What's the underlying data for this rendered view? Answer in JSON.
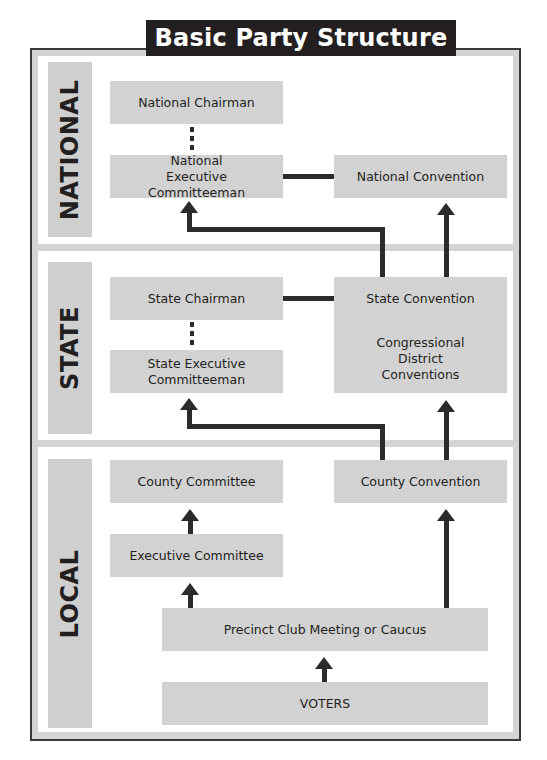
{
  "title": "Basic Party Structure",
  "levels": {
    "national": {
      "label": "NATIONAL",
      "national_chairman": "National Chairman",
      "national_executive_committeeman": "National Executive Committeeman",
      "national_convention": "National Convention"
    },
    "state": {
      "label": "STATE",
      "state_chairman": "State Chairman",
      "state_executive_committeeman": "State Executive Committeeman",
      "state_convention": "State Convention",
      "congressional_district_conventions": "Congressional District Conventions"
    },
    "local": {
      "label": "LOCAL",
      "county_committee": "County Committee",
      "county_convention": "County Convention",
      "executive_committee": "Executive Committee",
      "precinct_meeting": "Precinct Club Meeting or Caucus",
      "voters": "VOTERS"
    }
  },
  "colors": {
    "title_bg": "#231f20",
    "box_fill": "#d2d2d2",
    "connector": "#2b2b2b",
    "separator": "#d4d4d4"
  }
}
